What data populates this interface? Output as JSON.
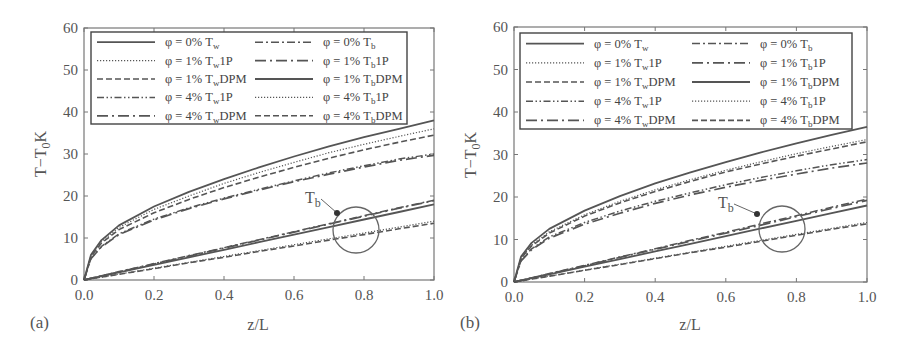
{
  "chart_data": [
    {
      "type": "line",
      "panel_label": "(a)",
      "xlabel": "z/L",
      "ylabel": "T−T₀K",
      "xlim": [
        0.0,
        1.0
      ],
      "ylim": [
        0,
        60
      ],
      "xticks": [
        "0.0",
        "0.2",
        "0.4",
        "0.6",
        "0.8",
        "1.0"
      ],
      "yticks": [
        "0",
        "10",
        "20",
        "30",
        "40",
        "50",
        "60"
      ],
      "grid": false,
      "legend_position": "upper inside, two columns",
      "annotation": {
        "text": "T_b",
        "target": "circle around bulk temperature curves near z/L≈0.78"
      },
      "x": [
        0,
        0.02,
        0.05,
        0.1,
        0.2,
        0.3,
        0.4,
        0.5,
        0.6,
        0.7,
        0.8,
        0.9,
        1.0
      ],
      "series": [
        {
          "name": "φ = 0% Tw",
          "style": "solid",
          "values": [
            0,
            6,
            9.5,
            13,
            17.5,
            21,
            24,
            26.8,
            29.4,
            31.8,
            34,
            36,
            38
          ]
        },
        {
          "name": "φ = 1% Tw 1P",
          "style": "dotted",
          "values": [
            0,
            5.8,
            9.2,
            12.5,
            16.8,
            20,
            23,
            25.6,
            28,
            30.3,
            32.3,
            34.2,
            36
          ]
        },
        {
          "name": "φ = 1% Tw DPM",
          "style": "dashed",
          "values": [
            0,
            5.6,
            8.8,
            12,
            16,
            19.2,
            22,
            24.5,
            26.8,
            29,
            31,
            32.8,
            34.5
          ]
        },
        {
          "name": "φ = 4% Tw 1P",
          "style": "dash-dot-dot",
          "values": [
            0,
            5.2,
            8,
            11,
            14.5,
            17.2,
            19.5,
            21.6,
            23.6,
            25.5,
            27.2,
            28.8,
            30
          ]
        },
        {
          "name": "φ = 4% Tw DPM",
          "style": "long-dash-dot",
          "values": [
            0,
            5.1,
            7.9,
            10.8,
            14.3,
            17,
            19.3,
            21.4,
            23.4,
            25.2,
            26.9,
            28.5,
            29.7
          ]
        },
        {
          "name": "φ = 0% Tb",
          "style": "dash-dot",
          "values": [
            0,
            0.4,
            1,
            2,
            3.9,
            5.8,
            7.7,
            9.6,
            11.5,
            13.4,
            15.3,
            17.2,
            19
          ]
        },
        {
          "name": "φ = 1% Tb 1P",
          "style": "long-dash-dot",
          "values": [
            0,
            0.4,
            1,
            1.9,
            3.8,
            5.7,
            7.6,
            9.5,
            11.4,
            13.3,
            15.2,
            17.1,
            18.9
          ]
        },
        {
          "name": "φ = 1% Tb DPM",
          "style": "solid",
          "values": [
            0,
            0.35,
            0.9,
            1.8,
            3.6,
            5.4,
            7.2,
            9,
            10.8,
            12.6,
            14.4,
            16.2,
            18
          ]
        },
        {
          "name": "φ = 4% Tb 1P",
          "style": "dotted",
          "values": [
            0,
            0.28,
            0.7,
            1.4,
            2.8,
            4.2,
            5.6,
            7,
            8.4,
            9.8,
            11.2,
            12.6,
            14
          ]
        },
        {
          "name": "φ = 4% Tb DPM",
          "style": "dashed",
          "values": [
            0,
            0.27,
            0.68,
            1.35,
            2.7,
            4.1,
            5.4,
            6.8,
            8.1,
            9.5,
            10.8,
            12.2,
            13.5
          ]
        }
      ]
    },
    {
      "type": "line",
      "panel_label": "(b)",
      "xlabel": "z/L",
      "ylabel": "T−T₀K",
      "xlim": [
        0.0,
        1.0
      ],
      "ylim": [
        0,
        60
      ],
      "xticks": [
        "0.0",
        "0.2",
        "0.4",
        "0.6",
        "0.8",
        "1.0"
      ],
      "yticks": [
        "0",
        "10",
        "20",
        "30",
        "40",
        "50",
        "60"
      ],
      "grid": false,
      "legend_position": "upper inside, two columns",
      "annotation": {
        "text": "T_b",
        "target": "circle around bulk temperature curves near z/L≈0.75"
      },
      "x": [
        0,
        0.02,
        0.05,
        0.1,
        0.2,
        0.3,
        0.4,
        0.5,
        0.6,
        0.7,
        0.8,
        0.9,
        1.0
      ],
      "series": [
        {
          "name": "φ = 0% Tw",
          "style": "solid",
          "values": [
            0,
            6,
            9.2,
            12.5,
            16.8,
            20.2,
            23.2,
            25.8,
            28.2,
            30.5,
            32.6,
            34.6,
            36.5
          ]
        },
        {
          "name": "φ = 1% Tw 1P",
          "style": "dotted",
          "values": [
            0,
            5.7,
            8.7,
            11.8,
            15.8,
            19,
            21.7,
            24.1,
            26.3,
            28.3,
            30.2,
            31.9,
            33.5
          ]
        },
        {
          "name": "φ = 1% Tw DPM",
          "style": "dashed",
          "values": [
            0,
            5.6,
            8.5,
            11.5,
            15.5,
            18.6,
            21.3,
            23.7,
            25.9,
            27.8,
            29.6,
            31.3,
            33
          ]
        },
        {
          "name": "φ = 4% Tw 1P",
          "style": "dash-dot-dot",
          "values": [
            0,
            5.1,
            7.8,
            10.6,
            14,
            16.7,
            19,
            21,
            22.9,
            24.6,
            26.2,
            27.6,
            28.8
          ]
        },
        {
          "name": "φ = 4% Tw DPM",
          "style": "long-dash-dot",
          "values": [
            0,
            5,
            7.6,
            10.3,
            13.6,
            16.2,
            18.5,
            20.5,
            22.3,
            23.9,
            25.4,
            26.8,
            28
          ]
        },
        {
          "name": "φ = 0% Tb",
          "style": "dash-dot",
          "values": [
            0,
            0.4,
            1,
            2,
            3.9,
            5.9,
            7.8,
            9.8,
            11.7,
            13.7,
            15.6,
            17.6,
            19.5
          ]
        },
        {
          "name": "φ = 1% Tb 1P",
          "style": "long-dash-dot",
          "values": [
            0,
            0.39,
            0.97,
            1.9,
            3.8,
            5.8,
            7.7,
            9.6,
            11.5,
            13.4,
            15.4,
            17.3,
            19.2
          ]
        },
        {
          "name": "φ = 1% Tb DPM",
          "style": "solid",
          "values": [
            0,
            0.36,
            0.9,
            1.8,
            3.6,
            5.4,
            7.2,
            9,
            10.8,
            12.6,
            14.4,
            16.2,
            18
          ]
        },
        {
          "name": "φ = 4% Tb 1P",
          "style": "dotted",
          "values": [
            0,
            0.28,
            0.7,
            1.4,
            2.8,
            4.2,
            5.6,
            7,
            8.4,
            9.8,
            11.2,
            12.6,
            14
          ]
        },
        {
          "name": "φ = 4% Tb DPM",
          "style": "dashed",
          "values": [
            0,
            0.27,
            0.68,
            1.37,
            2.75,
            4.1,
            5.5,
            6.9,
            8.2,
            9.6,
            11,
            12.4,
            13.7
          ]
        }
      ]
    }
  ],
  "legend": {
    "rows": [
      {
        "left": {
          "pre": "φ = 0% T",
          "sub": "w",
          "post": ""
        },
        "right": {
          "pre": "φ = 0% T",
          "sub": "b",
          "post": ""
        }
      },
      {
        "left": {
          "pre": "φ = 1% T",
          "sub": "w",
          "post": "1P"
        },
        "right": {
          "pre": "φ = 1% T",
          "sub": "b",
          "post": "1P"
        }
      },
      {
        "left": {
          "pre": "φ = 1% T",
          "sub": "w",
          "post": "DPM"
        },
        "right": {
          "pre": "φ = 1% T",
          "sub": "b",
          "post": "DPM"
        }
      },
      {
        "left": {
          "pre": "φ = 4% T",
          "sub": "w",
          "post": "1P"
        },
        "right": {
          "pre": "φ = 4% T",
          "sub": "b",
          "post": "1P"
        }
      },
      {
        "left": {
          "pre": "φ = 4% T",
          "sub": "w",
          "post": "DPM"
        },
        "right": {
          "pre": "φ = 4% T",
          "sub": "b",
          "post": "DPM"
        }
      }
    ]
  },
  "labels": {
    "ylabel_main": "T−T",
    "ylabel_sub": "0",
    "ylabel_post": "K",
    "xlabel": "z/L",
    "annot_main": "T",
    "annot_sub": "b"
  },
  "colors": {
    "line": "#555555",
    "axis": "#777777",
    "text": "#555555"
  }
}
